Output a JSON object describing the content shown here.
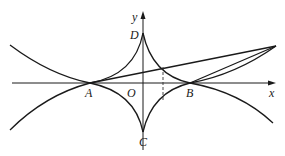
{
  "diagram": {
    "type": "geometry-curves",
    "axes": {
      "x_label": "x",
      "y_label": "y"
    },
    "points": {
      "origin": "O",
      "A": "A",
      "B": "B",
      "C": "C",
      "D": "D"
    },
    "colors": {
      "stroke": "#1a1a1a",
      "background": "#ffffff"
    }
  }
}
